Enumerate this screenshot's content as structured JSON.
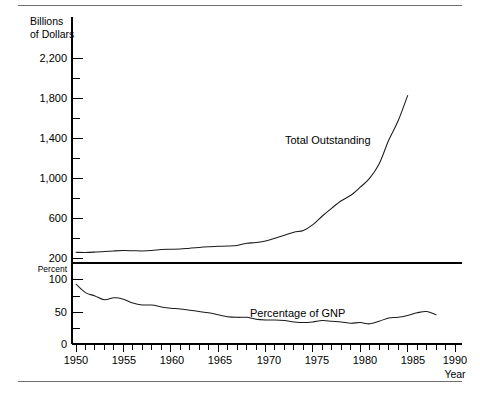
{
  "figure": {
    "top_rule": "rule",
    "bottom_rule": "rule"
  },
  "chart_data": {
    "type": "line",
    "title": "",
    "xlabel": "Year",
    "panels": [
      {
        "name": "total-outstanding",
        "ylabel_line1": "Billions",
        "ylabel_line2": "of Dollars",
        "series_label": "Total Outstanding",
        "ylim": [
          200,
          2300
        ],
        "yticks_major": [
          200,
          600,
          1000,
          1400,
          1800,
          2200
        ],
        "ytick_labels": [
          "200",
          "600",
          "1,000",
          "1,400",
          "1,800",
          "2,200"
        ],
        "yticks_minor": [
          400,
          800,
          1200,
          1600,
          2000
        ],
        "grid": false
      },
      {
        "name": "percentage-of-gnp",
        "ylabel": "Percent",
        "series_label": "Percentage of GNP",
        "ylim": [
          0,
          118
        ],
        "yticks_major": [
          0,
          50,
          100
        ],
        "ytick_labels": [
          "0",
          "50",
          "100"
        ],
        "yticks_minor": [
          25,
          75
        ],
        "grid": false
      }
    ],
    "xlim": [
      1950,
      1990
    ],
    "xticks_major": [
      1950,
      1955,
      1960,
      1965,
      1970,
      1975,
      1980,
      1985,
      1990
    ],
    "xtick_labels": [
      "1950",
      "1955",
      "1960",
      "1965",
      "1970",
      "1975",
      "1980",
      "1985",
      "1990"
    ],
    "xtick_minor_interval": 1,
    "x": [
      1950,
      1951,
      1952,
      1953,
      1954,
      1955,
      1956,
      1957,
      1958,
      1959,
      1960,
      1961,
      1962,
      1963,
      1964,
      1965,
      1966,
      1967,
      1968,
      1969,
      1970,
      1971,
      1972,
      1973,
      1974,
      1975,
      1976,
      1977,
      1978,
      1979,
      1980,
      1981,
      1982,
      1983,
      1984,
      1985,
      1986,
      1987,
      1988
    ],
    "series": [
      {
        "name": "Total Outstanding",
        "panel": "total-outstanding",
        "units": "Billions of Dollars",
        "values": [
          257,
          255,
          259,
          266,
          271,
          274,
          273,
          271,
          276,
          285,
          287,
          289,
          298,
          306,
          312,
          317,
          320,
          326,
          348,
          354,
          371,
          398,
          427,
          458,
          475,
          533,
          620,
          699,
          772,
          827,
          908,
          998,
          1142,
          1377,
          1572,
          1824,
          2120,
          2346,
          2600
        ],
        "visible_range": [
          200,
          1850
        ],
        "endpoint_value": 1850
      },
      {
        "name": "Percentage of GNP",
        "panel": "percentage-of-gnp",
        "units": "Percent",
        "values": [
          92,
          79,
          74,
          68,
          71,
          69,
          63,
          60,
          60,
          57,
          55,
          54,
          52,
          50,
          48,
          45,
          42,
          41,
          41,
          38,
          37,
          37,
          36,
          34,
          33,
          34,
          36,
          35,
          34,
          32,
          33,
          31,
          35,
          40,
          41,
          44,
          48,
          50,
          45
        ]
      }
    ]
  },
  "labels": {
    "billions_line1": "Billions",
    "billions_line2": "of Dollars",
    "percent": "Percent",
    "year": "Year",
    "total_outstanding": "Total Outstanding",
    "percentage_of_gnp": "Percentage of GNP",
    "y_2200": "2,200",
    "y_1800": "1,800",
    "y_1400": "1,400",
    "y_1000": "1,000",
    "y_600": "600",
    "y_200": "200",
    "y_100": "100",
    "y_50": "50",
    "y_0": "0",
    "x_1950": "1950",
    "x_1955": "1955",
    "x_1960": "1960",
    "x_1965": "1965",
    "x_1970": "1970",
    "x_1975": "1975",
    "x_1980": "1980",
    "x_1985": "1985",
    "x_1990": "1990"
  },
  "colors": {
    "line": "#1a1a1a",
    "axis": "#000000",
    "rule": "#6f6f6f",
    "background": "#ffffff"
  }
}
